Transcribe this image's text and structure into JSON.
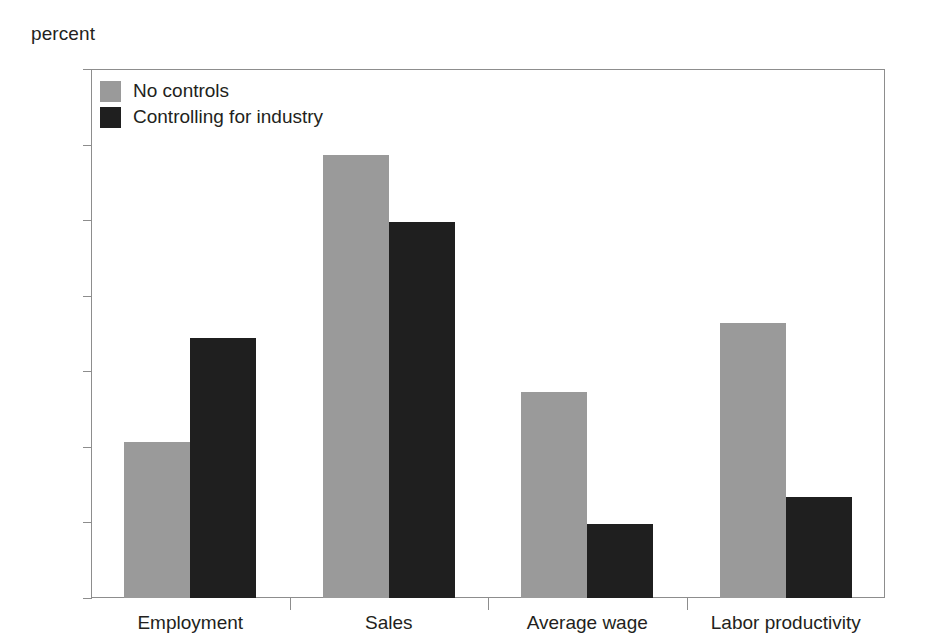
{
  "chart_data": {
    "type": "bar",
    "title": "",
    "subtitle": "",
    "xlabel": "",
    "ylabel": "percent",
    "unit_label": "percent",
    "categories": [
      "Employment",
      "Sales",
      "Average wage",
      "Labor productivity"
    ],
    "series": [
      {
        "name": "No controls",
        "color": "#9a9a9a",
        "values": [
          41.3,
          117.3,
          54.5,
          72.8
        ]
      },
      {
        "name": "Controlling for industry",
        "color": "#1f1f1f",
        "values": [
          68.8,
          99.5,
          19.5,
          26.8
        ]
      }
    ],
    "ylim": [
      0,
      140
    ],
    "yticks": [
      0,
      20,
      40,
      60,
      80,
      100,
      120,
      140
    ],
    "ytick_labels": [
      "0",
      "20",
      "40",
      "60",
      "80",
      "100",
      "120",
      "140"
    ],
    "grid": false,
    "legend_position": "top-left",
    "legend_entries": [
      "No controls",
      "Controlling for industry"
    ],
    "annotations": []
  }
}
